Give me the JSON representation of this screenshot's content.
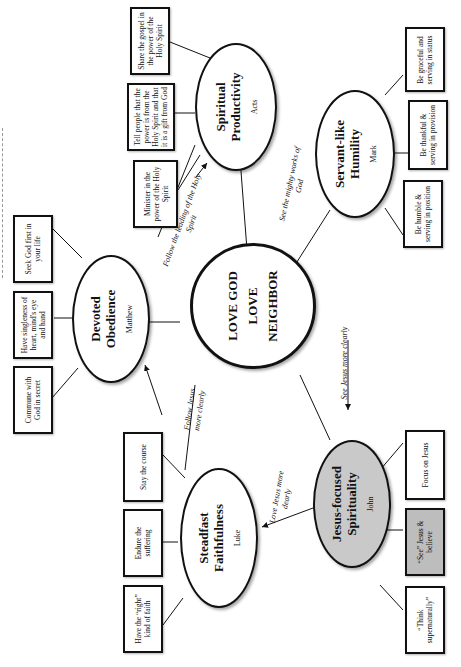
{
  "diagram": {
    "orientation": "rotated-90-ccw",
    "center": {
      "line1": "LOVE GOD",
      "line2": "LOVE",
      "line3": "NEIGHBOR"
    },
    "nodes": [
      {
        "id": "spiritual-productivity",
        "title_line1": "Spiritual",
        "title_line2": "Productivity",
        "book": "Acts"
      },
      {
        "id": "servant-like-humility",
        "title_line1": "Servant-like",
        "title_line2": "Humility",
        "book": "Mark"
      },
      {
        "id": "devoted-obedience",
        "title_line1": "Devoted",
        "title_line2": "Obedience",
        "book": "Matthew"
      },
      {
        "id": "steadfast-faithfulness",
        "title_line1": "Steadfast",
        "title_line2": "Faithfulness",
        "book": "Luke"
      },
      {
        "id": "jesus-focused-spirituality",
        "title_line1": "Jesus-focused",
        "title_line2": "Spirituality",
        "book": "John"
      }
    ],
    "boxes": {
      "acts": [
        "Share the gospel in the power of the Holy Spirit",
        "Tell people that the power is from the Holy Spirit and that it is a gift from God",
        "Minister in the power of the Holy Spirit"
      ],
      "mark": [
        "Be graceful and serving in status",
        "Be thankful & serving in provision",
        "Be humble & serving in position"
      ],
      "matthew": [
        "Seek God first in your life",
        "Have singleness of heart, mind's eye and hand",
        "Commune with God in secret"
      ],
      "luke": [
        "Stay the course",
        "Endure the suffering",
        "Have the “right” kind of faith"
      ],
      "john": [
        "Focus on Jesus",
        "“See” Jesus & believe",
        "“Think supernaturally”"
      ]
    },
    "edge_labels": {
      "matthew_to_acts": "Follow the leading of the Holy Spirit",
      "acts_to_mark": "See the mighty works of God",
      "mark_to_john": "See Jesus more clearly",
      "john_to_luke": "Love Jesus more dearly",
      "luke_to_matthew": "Follow Jesus more clearly"
    },
    "colors": {
      "line": "#111111",
      "shaded_node": "#c9c9c9",
      "shaded_box": "#bdbdbd",
      "background": "#ffffff"
    }
  }
}
